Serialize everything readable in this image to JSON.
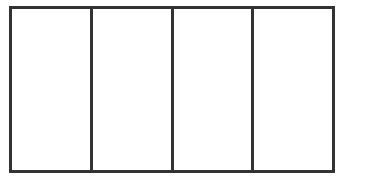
{
  "diagram": {
    "type": "partitioned-rectangle",
    "columns": 4,
    "rows": 1,
    "stroke_color": "#333333",
    "fill_color": "#ffffff",
    "cells": [
      {
        "label": ""
      },
      {
        "label": ""
      },
      {
        "label": ""
      },
      {
        "label": ""
      }
    ]
  }
}
